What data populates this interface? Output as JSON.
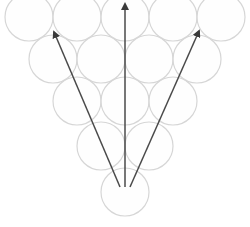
{
  "diagram": {
    "type": "circle-pyramid-with-arrows",
    "colors": {
      "circle_stroke": "#d6d6d6",
      "circle_fill": "#fdfdfd",
      "arrow": "#4a4a4a",
      "background": "#ffffff"
    },
    "circle_radius": 24,
    "rows": [
      {
        "y": 17,
        "xs": [
          29,
          77,
          125,
          173,
          221
        ]
      },
      {
        "y": 59,
        "xs": [
          53,
          101,
          149,
          197
        ]
      },
      {
        "y": 101,
        "xs": [
          77,
          125,
          173
        ]
      },
      {
        "y": 146,
        "xs": [
          101,
          149
        ]
      },
      {
        "y": 192,
        "xs": [
          125
        ]
      }
    ],
    "arrows": [
      {
        "name": "arrow-left",
        "x1": 120,
        "y1": 187,
        "x2": 54,
        "y2": 32
      },
      {
        "name": "arrow-center",
        "x1": 125,
        "y1": 187,
        "x2": 125,
        "y2": 4
      },
      {
        "name": "arrow-right",
        "x1": 130,
        "y1": 187,
        "x2": 199,
        "y2": 31
      }
    ]
  }
}
